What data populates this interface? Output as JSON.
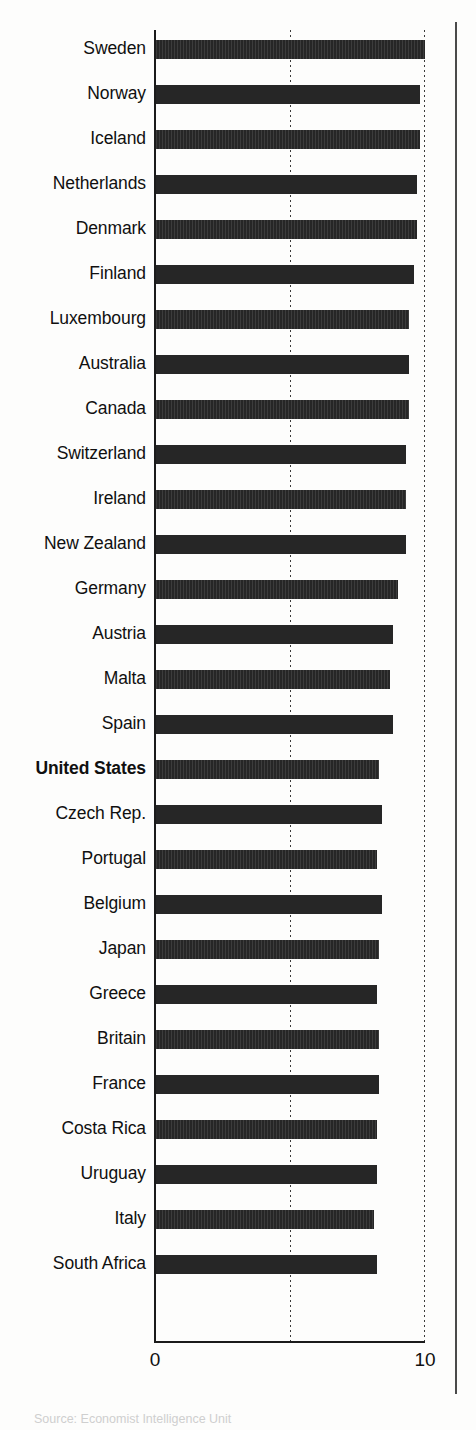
{
  "figure": {
    "axis_label_left": "0",
    "axis_label_right": "10",
    "source_note": "Source: Economist Intelligence Unit"
  },
  "chart_data": {
    "type": "bar",
    "orientation": "horizontal",
    "title": "",
    "subtitle": "",
    "xlabel": "",
    "ylabel": "",
    "xlim": [
      0,
      10
    ],
    "xticks": [
      0,
      10
    ],
    "xticklabels": [
      "0",
      "10"
    ],
    "gridlines": [
      5,
      10
    ],
    "grid": true,
    "legend": false,
    "highlight": "United States",
    "categories": [
      "Sweden",
      "Norway",
      "Iceland",
      "Netherlands",
      "Denmark",
      "Finland",
      "Luxembourg",
      "Australia",
      "Canada",
      "Switzerland",
      "Ireland",
      "New Zealand",
      "Germany",
      "Austria",
      "Malta",
      "Spain",
      "United States",
      "Czech Rep.",
      "Portugal",
      "Belgium",
      "Japan",
      "Greece",
      "Britain",
      "France",
      "Costa Rica",
      "Uruguay",
      "Italy",
      "South Africa"
    ],
    "values": [
      10.0,
      9.8,
      9.8,
      9.7,
      9.7,
      9.6,
      9.4,
      9.4,
      9.4,
      9.3,
      9.3,
      9.3,
      9.0,
      8.8,
      8.7,
      8.8,
      8.3,
      8.4,
      8.2,
      8.4,
      8.3,
      8.2,
      8.3,
      8.3,
      8.2,
      8.2,
      8.1,
      8.2
    ]
  },
  "rows": [
    {
      "label": "Sweden",
      "value": 10.0
    },
    {
      "label": "Norway",
      "value": 9.8
    },
    {
      "label": "Iceland",
      "value": 9.8
    },
    {
      "label": "Netherlands",
      "value": 9.7
    },
    {
      "label": "Denmark",
      "value": 9.7
    },
    {
      "label": "Finland",
      "value": 9.6
    },
    {
      "label": "Luxembourg",
      "value": 9.4
    },
    {
      "label": "Australia",
      "value": 9.4
    },
    {
      "label": "Canada",
      "value": 9.4
    },
    {
      "label": "Switzerland",
      "value": 9.3
    },
    {
      "label": "Ireland",
      "value": 9.3
    },
    {
      "label": "New Zealand",
      "value": 9.3
    },
    {
      "label": "Germany",
      "value": 9.0
    },
    {
      "label": "Austria",
      "value": 8.8
    },
    {
      "label": "Malta",
      "value": 8.7
    },
    {
      "label": "Spain",
      "value": 8.8
    },
    {
      "label": "United States",
      "value": 8.3
    },
    {
      "label": "Czech Rep.",
      "value": 8.4
    },
    {
      "label": "Portugal",
      "value": 8.2
    },
    {
      "label": "Belgium",
      "value": 8.4
    },
    {
      "label": "Japan",
      "value": 8.3
    },
    {
      "label": "Greece",
      "value": 8.2
    },
    {
      "label": "Britain",
      "value": 8.3
    },
    {
      "label": "France",
      "value": 8.3
    },
    {
      "label": "Costa Rica",
      "value": 8.2
    },
    {
      "label": "Uruguay",
      "value": 8.2
    },
    {
      "label": "Italy",
      "value": 8.1
    },
    {
      "label": "South Africa",
      "value": 8.2
    }
  ]
}
